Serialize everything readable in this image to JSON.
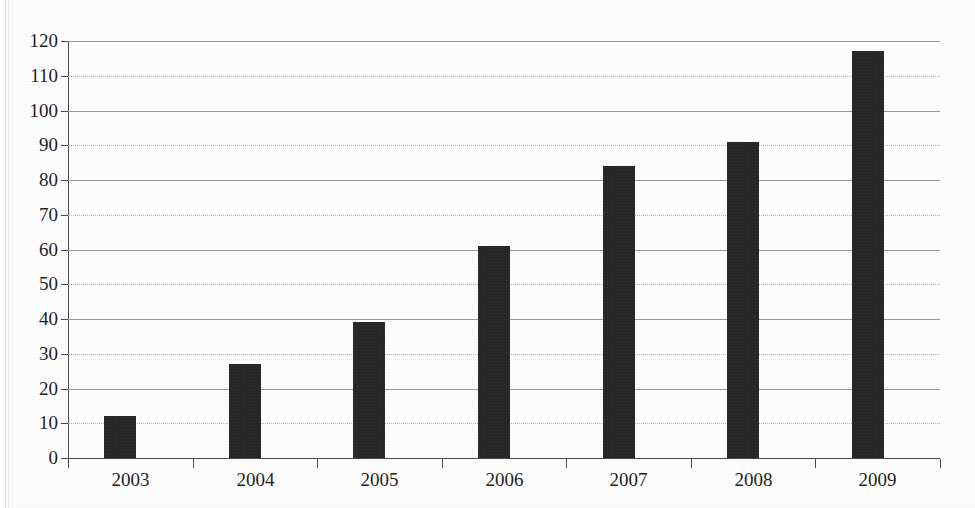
{
  "figure": {
    "clipped_caption": "",
    "background_color": "#fdfdfd",
    "bar_color": "#262626",
    "axis_color": "#4a4a4a",
    "gridline_color": "#9a9a9a"
  },
  "chart_data": {
    "type": "bar",
    "title": "",
    "subtitle": "",
    "xlabel": "",
    "ylabel": "",
    "categories": [
      "2003",
      "2004",
      "2005",
      "2006",
      "2007",
      "2008",
      "2009"
    ],
    "values": [
      12,
      27,
      39,
      61,
      84,
      91,
      117
    ],
    "ylim": [
      0,
      120
    ],
    "ytick_step": 10,
    "ytick_labels": [
      "0",
      "10",
      "20",
      "30",
      "40",
      "50",
      "60",
      "70",
      "80",
      "90",
      "100",
      "110",
      "120"
    ],
    "xtick_labels": [
      "2003",
      "2004",
      "2005",
      "2006",
      "2007",
      "2008",
      "2009"
    ],
    "grid": "horizontal",
    "legend": "none",
    "annotations": [],
    "series": [
      {
        "name": "",
        "values": [
          12,
          27,
          39,
          61,
          84,
          91,
          117
        ]
      }
    ]
  }
}
